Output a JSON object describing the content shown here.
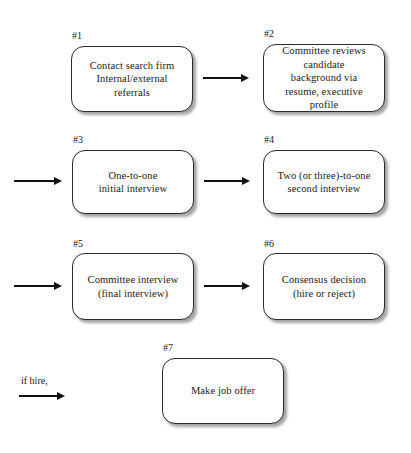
{
  "diagram": {
    "background_color": "#ffffff",
    "node_border_color": "#2b2b2b",
    "text_color": "#1a1a1a",
    "nodes": [
      {
        "tag": "#1",
        "text": "Contact search firm\nInternal/external\nreferrals"
      },
      {
        "tag": "#2",
        "text": "Committee reviews\ncandidate\nbackground via\nresume, executive\nprofile"
      },
      {
        "tag": "#3",
        "text": "One-to-one\ninitial interview"
      },
      {
        "tag": "#4",
        "text": "Two (or three)-to-one\nsecond interview"
      },
      {
        "tag": "#5",
        "text": "Committee interview\n(final interview)"
      },
      {
        "tag": "#6",
        "text": "Consensus decision\n(hire or reject)"
      },
      {
        "tag": "#7",
        "text": "Make job offer"
      }
    ],
    "edge_labels": {
      "if_hire": "if hire,"
    }
  }
}
